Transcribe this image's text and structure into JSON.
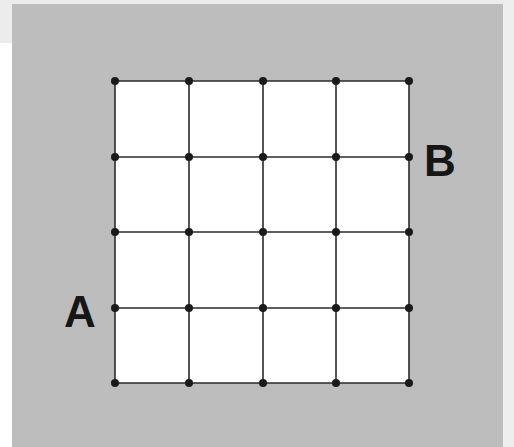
{
  "diagram": {
    "type": "grid-lattice",
    "rows": 4,
    "cols": 4,
    "x_coords": [
      115,
      189,
      263,
      336,
      409
    ],
    "y_coords": [
      81,
      157,
      232,
      308,
      383
    ],
    "colors": {
      "background_panel": "#bdbdbd",
      "grid_fill": "#ffffff",
      "line": "#2a2a2a",
      "node": "#1a1a1a",
      "label": "#161616"
    },
    "labels": {
      "a": {
        "text": "A",
        "attached_to": "left edge, row 4 node"
      },
      "b": {
        "text": "B",
        "attached_to": "right edge, row 2 node"
      }
    }
  }
}
